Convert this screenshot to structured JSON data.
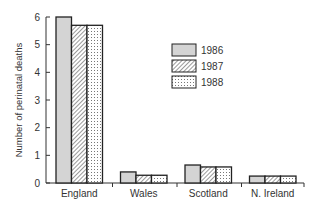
{
  "chart_data": {
    "type": "bar",
    "title": "",
    "xlabel": "",
    "ylabel": "Number of perinatal deaths",
    "categories": [
      "England",
      "Wales",
      "Scotland",
      "N. Ireland"
    ],
    "series": [
      {
        "name": "1986",
        "pattern": "solid-grey",
        "values": [
          6.0,
          0.4,
          0.65,
          0.25
        ]
      },
      {
        "name": "1987",
        "pattern": "diagonal-hatch",
        "values": [
          5.7,
          0.28,
          0.58,
          0.25
        ]
      },
      {
        "name": "1988",
        "pattern": "dotted",
        "values": [
          5.7,
          0.28,
          0.58,
          0.25
        ]
      }
    ],
    "yticks": [
      0,
      1,
      2,
      3,
      4,
      5,
      6
    ],
    "ylim": [
      0,
      6
    ],
    "grid": false,
    "legend_position": "upper-right-inside"
  },
  "legend": {
    "items": [
      "1986",
      "1987",
      "1988"
    ]
  },
  "colors": {
    "bar_fill_1986": "#d4d4d4",
    "stroke": "#222222"
  }
}
